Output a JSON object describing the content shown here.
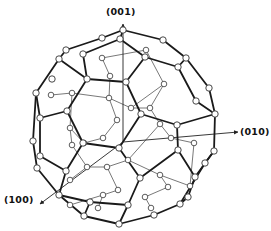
{
  "diagram": {
    "axes": [
      {
        "id": "z",
        "label": "(001)",
        "from": [
          123,
          142
        ],
        "to": [
          123,
          24
        ]
      },
      {
        "id": "y",
        "label": "(010)",
        "from": [
          123,
          142
        ],
        "to": [
          238,
          132
        ]
      },
      {
        "id": "x",
        "label": "(100)",
        "from": [
          123,
          142
        ],
        "to": [
          40,
          204
        ]
      }
    ],
    "label_positions": {
      "z": [
        106,
        6
      ],
      "y": [
        240,
        126
      ],
      "x": [
        4,
        194
      ]
    },
    "colors": {
      "front_bond": "#1a1a1a",
      "back_bond": "#555555",
      "atom_fill": "#ffffff",
      "atom_stroke": "#333333",
      "axis": "#222222"
    },
    "front_atoms": [
      [
        123,
        30
      ],
      [
        120,
        39
      ],
      [
        102,
        38
      ],
      [
        66,
        50
      ],
      [
        59,
        59
      ],
      [
        83,
        54
      ],
      [
        163,
        40
      ],
      [
        145,
        57
      ],
      [
        186,
        58
      ],
      [
        178,
        67
      ],
      [
        87,
        79
      ],
      [
        126,
        82
      ],
      [
        52,
        79
      ],
      [
        36,
        93
      ],
      [
        67,
        111
      ],
      [
        40,
        118
      ],
      [
        141,
        114
      ],
      [
        209,
        88
      ],
      [
        196,
        101
      ],
      [
        215,
        114
      ],
      [
        177,
        125
      ],
      [
        83,
        143
      ],
      [
        119,
        148
      ],
      [
        33,
        141
      ],
      [
        40,
        156
      ],
      [
        37,
        168
      ],
      [
        66,
        171
      ],
      [
        178,
        150
      ],
      [
        214,
        151
      ],
      [
        140,
        178
      ],
      [
        195,
        177
      ],
      [
        90,
        202
      ],
      [
        128,
        205
      ],
      [
        84,
        216
      ],
      [
        119,
        224
      ],
      [
        154,
        215
      ],
      [
        180,
        204
      ],
      [
        59,
        195
      ],
      [
        188,
        197
      ],
      [
        205,
        163
      ]
    ],
    "front_bonds": [
      [
        0,
        1
      ],
      [
        0,
        2
      ],
      [
        0,
        6
      ],
      [
        2,
        3
      ],
      [
        3,
        4
      ],
      [
        1,
        5
      ],
      [
        5,
        10
      ],
      [
        4,
        10
      ],
      [
        4,
        13
      ],
      [
        6,
        8
      ],
      [
        1,
        7
      ],
      [
        7,
        9
      ],
      [
        8,
        9
      ],
      [
        7,
        11
      ],
      [
        10,
        11
      ],
      [
        10,
        14
      ],
      [
        13,
        15
      ],
      [
        15,
        14
      ],
      [
        14,
        21
      ],
      [
        11,
        16
      ],
      [
        16,
        20
      ],
      [
        20,
        19
      ],
      [
        9,
        18
      ],
      [
        18,
        19
      ],
      [
        8,
        17
      ],
      [
        17,
        19
      ],
      [
        21,
        22
      ],
      [
        22,
        16
      ],
      [
        15,
        24
      ],
      [
        13,
        23
      ],
      [
        23,
        25
      ],
      [
        24,
        26
      ],
      [
        21,
        26
      ],
      [
        22,
        29
      ],
      [
        20,
        27
      ],
      [
        27,
        29
      ],
      [
        19,
        28
      ],
      [
        28,
        30
      ],
      [
        27,
        30
      ],
      [
        26,
        37
      ],
      [
        25,
        37
      ],
      [
        29,
        32
      ],
      [
        32,
        31
      ],
      [
        31,
        37
      ],
      [
        31,
        33
      ],
      [
        32,
        34
      ],
      [
        33,
        34
      ],
      [
        34,
        35
      ],
      [
        35,
        36
      ],
      [
        36,
        38
      ],
      [
        38,
        30
      ],
      [
        28,
        39
      ],
      [
        39,
        36
      ],
      [
        37,
        33
      ]
    ],
    "back_atoms": [
      [
        102,
        58
      ],
      [
        110,
        76
      ],
      [
        146,
        50
      ],
      [
        164,
        84
      ],
      [
        51,
        95
      ],
      [
        72,
        93
      ],
      [
        70,
        128
      ],
      [
        84,
        143
      ],
      [
        103,
        138
      ],
      [
        160,
        124
      ],
      [
        150,
        108
      ],
      [
        171,
        138
      ],
      [
        194,
        143
      ],
      [
        87,
        167
      ],
      [
        70,
        180
      ],
      [
        107,
        167
      ],
      [
        128,
        160
      ],
      [
        160,
        175
      ],
      [
        168,
        187
      ],
      [
        145,
        197
      ],
      [
        103,
        195
      ],
      [
        118,
        190
      ],
      [
        70,
        205
      ],
      [
        98,
        208
      ],
      [
        151,
        208
      ],
      [
        190,
        186
      ],
      [
        109,
        98
      ],
      [
        131,
        108
      ],
      [
        72,
        145
      ],
      [
        117,
        120
      ]
    ],
    "back_bonds": [
      [
        0,
        1
      ],
      [
        0,
        2
      ],
      [
        2,
        3
      ],
      [
        1,
        26
      ],
      [
        26,
        27
      ],
      [
        27,
        3
      ],
      [
        4,
        5
      ],
      [
        5,
        6
      ],
      [
        6,
        7
      ],
      [
        7,
        8
      ],
      [
        8,
        29
      ],
      [
        29,
        26
      ],
      [
        3,
        10
      ],
      [
        10,
        9
      ],
      [
        9,
        11
      ],
      [
        11,
        12
      ],
      [
        6,
        28
      ],
      [
        28,
        13
      ],
      [
        13,
        14
      ],
      [
        13,
        15
      ],
      [
        15,
        16
      ],
      [
        16,
        9
      ],
      [
        15,
        21
      ],
      [
        21,
        20
      ],
      [
        20,
        22
      ],
      [
        16,
        17
      ],
      [
        17,
        18
      ],
      [
        18,
        19
      ],
      [
        19,
        24
      ],
      [
        17,
        25
      ],
      [
        20,
        23
      ],
      [
        12,
        25
      ],
      [
        10,
        27
      ],
      [
        5,
        26
      ]
    ]
  }
}
